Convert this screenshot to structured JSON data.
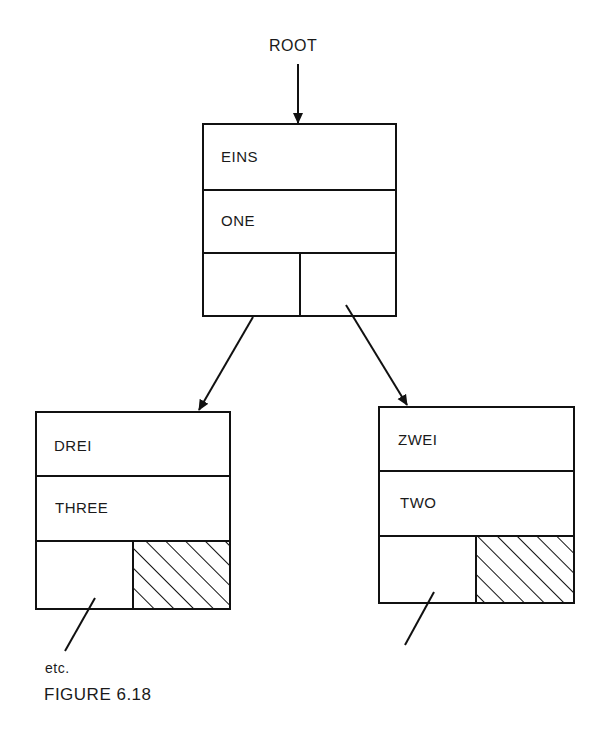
{
  "diagram": {
    "root_label": "ROOT",
    "nodes": [
      {
        "id": "root",
        "key": "EINS",
        "value": "ONE",
        "x": 203,
        "y": 124,
        "w": 193,
        "h": 192,
        "left_null": false,
        "right_null": false
      },
      {
        "id": "left",
        "key": "DREI",
        "value": "THREE",
        "x": 36,
        "y": 412,
        "w": 194,
        "h": 197,
        "left_null": false,
        "right_null": true
      },
      {
        "id": "right",
        "key": "ZWEI",
        "value": "TWO",
        "x": 379,
        "y": 407,
        "w": 195,
        "h": 196,
        "left_null": false,
        "right_null": true
      }
    ],
    "continuation_label": "etc.",
    "caption": "FIGURE 6.18"
  }
}
